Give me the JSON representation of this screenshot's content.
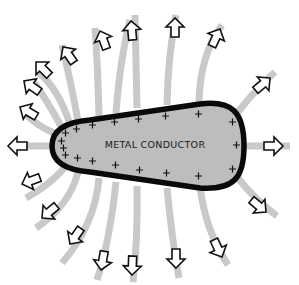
{
  "diagram": {
    "conductor_label": "METAL CONDUCTOR",
    "charge_symbol": "+",
    "charge_sign": "positive",
    "colors": {
      "background": "#ffffff",
      "conductor_fill": "#bdbdbd",
      "conductor_outline": "#0a0a0a",
      "field_line": "#c9c9c9",
      "arrow_fill": "#ffffff",
      "arrow_outline": "#111111"
    },
    "field_line_count": 19,
    "arrow_direction": "outward"
  }
}
